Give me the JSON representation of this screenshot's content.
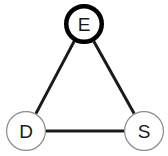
{
  "diagram": {
    "type": "node-link-graph",
    "canvas": {
      "width": 168,
      "height": 156,
      "background": "#ffffff"
    },
    "style": {
      "edge_color": "#1a1a1a",
      "edge_width": 3,
      "node_fill": "#ffffff",
      "node_radius": 20,
      "highlight_stroke_color": "#000000",
      "highlight_stroke_width": 4.5,
      "normal_stroke_color": "#8a8a8a",
      "normal_stroke_width": 1.2,
      "label_color": "#1a1a1a"
    },
    "nodes": [
      {
        "id": "E",
        "label": "E",
        "cx": 84,
        "cy": 24,
        "r": 20,
        "emphasis": "bold",
        "stroke": "#000000",
        "stroke_width": 4.5
      },
      {
        "id": "D",
        "label": "D",
        "cx": 26,
        "cy": 131,
        "r": 20,
        "emphasis": "normal",
        "stroke": "#8a8a8a",
        "stroke_width": 1.2
      },
      {
        "id": "S",
        "label": "S",
        "cx": 144,
        "cy": 131,
        "r": 20,
        "emphasis": "normal",
        "stroke": "#8a8a8a",
        "stroke_width": 1.2
      }
    ],
    "edges": [
      {
        "id": "E-D",
        "from": "E",
        "to": "D",
        "x1": 74.1,
        "y1": 41.4,
        "x2": 35.9,
        "y2": 113.6,
        "width": 3,
        "color": "#1a1a1a"
      },
      {
        "id": "E-S",
        "from": "E",
        "to": "S",
        "x1": 93.9,
        "y1": 41.4,
        "x2": 134.1,
        "y2": 113.6,
        "width": 3,
        "color": "#1a1a1a"
      },
      {
        "id": "D-S",
        "from": "D",
        "to": "S",
        "x1": 46,
        "y1": 131,
        "x2": 124,
        "y2": 131,
        "width": 3,
        "color": "#1a1a1a"
      }
    ]
  }
}
